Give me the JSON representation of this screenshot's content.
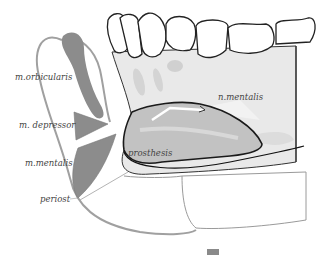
{
  "figure": {
    "type": "anatomical-cross-section",
    "colors": {
      "outline": "#222222",
      "muscle_gray": "#8c8c8c",
      "bone_light": "#e9e9e9",
      "prosthesis_gray": "#bdbdbd",
      "soft_tissue_outline": "#9a9a9a",
      "background": "#ffffff"
    }
  },
  "labels": {
    "orbicularis": "m.orbicularis",
    "depressor": "m. depressor",
    "mentalis": "m.mentalis",
    "periost": "periost",
    "prosthesis": "prosthesis",
    "n_mentalis": "n.mentalis"
  }
}
